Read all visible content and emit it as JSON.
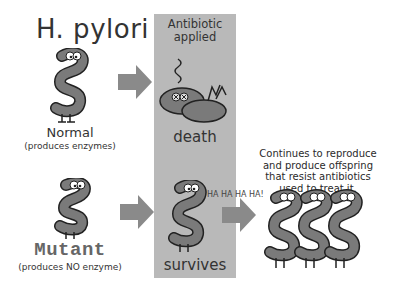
{
  "title": "H. pylori",
  "panel": {
    "label_line1": "Antibiotic",
    "label_line2": "applied",
    "death_label": "death",
    "survives_label": "survives",
    "background_color": "#b9b9b9"
  },
  "normal": {
    "label": "Normal",
    "sublabel": "(produces enzymes)"
  },
  "mutant": {
    "label": "Mutant",
    "sublabel": "(produces NO enzyme)"
  },
  "offspring": {
    "line1": "Continues to reproduce",
    "line2": "and produce offspring",
    "line3": "that resist antibiotics",
    "line4": "used to treat it.",
    "laugh": "HA HA HA HA!"
  },
  "colors": {
    "arrow": "#8a8a8a",
    "bacterium": "#7a7a7a",
    "bacterium_outline": "#222222"
  },
  "icons": [
    "bacterium-normal-icon",
    "bacterium-dead-icon",
    "bacterium-mutant-icon",
    "bacterium-survivor-icon",
    "bacteria-offspring-icon",
    "arrow-right-icon"
  ]
}
